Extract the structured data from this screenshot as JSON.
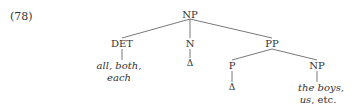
{
  "example_number": "(78)",
  "tree": {
    "root": "NP",
    "det": "DET",
    "det_leaf_line1": "all, both,",
    "det_leaf_line2": "each",
    "n": "N",
    "n_leaf": "Δ",
    "pp": "PP",
    "p": "P",
    "p_leaf": "Δ",
    "np2": "NP",
    "np2_leaf_line1": "the boys,",
    "np2_leaf_line2_italic": "us",
    "np2_leaf_line2_rest": ", etc."
  }
}
